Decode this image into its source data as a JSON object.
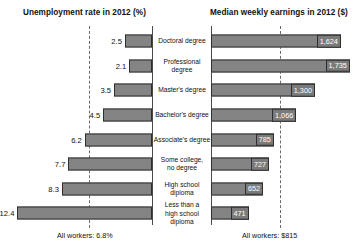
{
  "header": {
    "left_title": "Unemployment rate in 2012 (%)",
    "right_title": "Median weekly earnings in 2012 ($)"
  },
  "footnotes": {
    "left": "All workers: 6.8%",
    "right": "All workers: $815"
  },
  "chart_data": {
    "type": "bar",
    "title": "",
    "subtitle": "",
    "orientation": "horizontal",
    "layout": "back-to-back diverging (butterfly) with shared center category labels",
    "grid": false,
    "legend": null,
    "categories": [
      "Doctoral degree",
      "Professional degree",
      "Master's degree",
      "Bachelor's degree",
      "Associate's degree",
      "Some college,\nno degree",
      "High school diploma",
      "Less than a\nhigh school diploma"
    ],
    "panels": [
      {
        "name": "unemployment",
        "side": "left",
        "xlabel": "Unemployment rate in 2012 (%)",
        "ylabel": "",
        "direction": "right-to-left",
        "xlim": [
          0,
          14
        ],
        "values": [
          2.5,
          2.1,
          3.5,
          4.5,
          6.2,
          7.7,
          8.3,
          12.4
        ],
        "data_labels": [
          "2.5",
          "2.1",
          "3.5",
          "4.5",
          "6.2",
          "7.7",
          "8.3",
          "12.4"
        ],
        "reference_line": {
          "value": 6.8,
          "label": "All workers: 6.8%",
          "style": "dashed"
        }
      },
      {
        "name": "earnings",
        "side": "right",
        "xlabel": "Median weekly earnings in 2012 ($)",
        "ylabel": "",
        "direction": "left-to-right",
        "xlim": [
          0,
          1900
        ],
        "values": [
          1624,
          1735,
          1300,
          1066,
          785,
          727,
          652,
          471
        ],
        "data_labels": [
          "1,624",
          "1,735",
          "1,300",
          "1,066",
          "785",
          "727",
          "652",
          "471"
        ],
        "reference_line": {
          "value": 815,
          "label": "All workers: $815",
          "style": "dashed"
        }
      }
    ],
    "rows": [
      {
        "category": "Doctoral degree",
        "unemployment": 2.5,
        "unemployment_label": "2.5",
        "earnings": 1624,
        "earnings_label": "1,624"
      },
      {
        "category": "Professional degree",
        "unemployment": 2.1,
        "unemployment_label": "2.1",
        "earnings": 1735,
        "earnings_label": "1,735"
      },
      {
        "category": "Master's degree",
        "unemployment": 3.5,
        "unemployment_label": "3.5",
        "earnings": 1300,
        "earnings_label": "1,300"
      },
      {
        "category": "Bachelor's degree",
        "unemployment": 4.5,
        "unemployment_label": "4.5",
        "earnings": 1066,
        "earnings_label": "1,066"
      },
      {
        "category": "Associate's degree",
        "unemployment": 6.2,
        "unemployment_label": "6.2",
        "earnings": 785,
        "earnings_label": "785"
      },
      {
        "category": "Some college, no degree",
        "category_lines": [
          "Some college,",
          "no degree"
        ],
        "unemployment": 7.7,
        "unemployment_label": "7.7",
        "earnings": 727,
        "earnings_label": "727"
      },
      {
        "category": "High school diploma",
        "unemployment": 8.3,
        "unemployment_label": "8.3",
        "earnings": 652,
        "earnings_label": "652"
      },
      {
        "category": "Less than a high school diploma",
        "category_lines": [
          "Less than a",
          "high school diploma"
        ],
        "unemployment": 12.4,
        "unemployment_label": "12.4",
        "earnings": 471,
        "earnings_label": "471"
      }
    ],
    "colors": {
      "bar_fill": "#848484",
      "bar_border": "#2e2e2e",
      "axis": "#4a4a4a",
      "reference_line": "#6b6b6b",
      "text": "#111111",
      "value_label_text": "#ffffff",
      "background": "#ffffff"
    }
  }
}
